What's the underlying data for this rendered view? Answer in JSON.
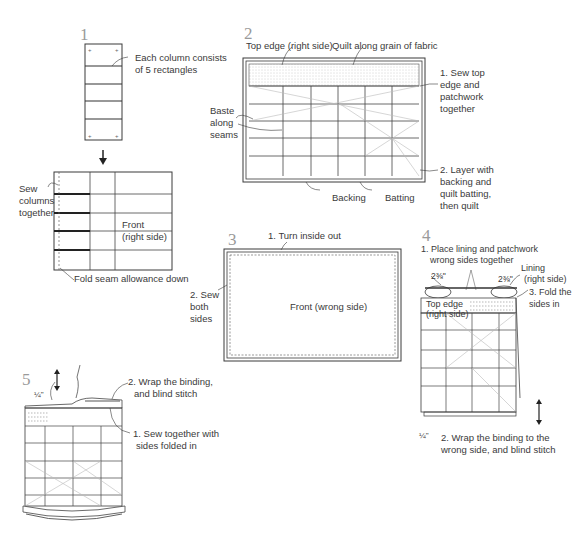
{
  "figure": {
    "type": "sewing-instruction-diagram",
    "steps": [
      {
        "number": "1",
        "labels": {
          "column": "Each column consists",
          "column_2": "of 5 rectangles",
          "sew_1": "Sew",
          "sew_2": "columns",
          "sew_3": "together",
          "front_1": "Front",
          "front_2": "(right side)",
          "fold": "Fold seam allowance down"
        }
      },
      {
        "number": "2",
        "labels": {
          "top_edge": "Top edge (right side)",
          "quilt": "Quilt along grain of fabric",
          "sew_top_1": "1. Sew top",
          "sew_top_2": "edge and",
          "sew_top_3": "patchwork",
          "sew_top_4": "together",
          "baste_1": "Baste",
          "baste_2": "along",
          "baste_3": "seams",
          "layer_1": "2. Layer with",
          "layer_2": "backing and",
          "layer_3": "quilt batting,",
          "layer_4": "then quilt",
          "backing": "Backing",
          "batting": "Batting"
        }
      },
      {
        "number": "3",
        "labels": {
          "turn": "1. Turn inside out",
          "sew_1": "2. Sew",
          "sew_2": "both",
          "sew_3": "sides",
          "front": "Front (wrong side)"
        }
      },
      {
        "number": "4",
        "labels": {
          "place_1": "1. Place lining and patchwork",
          "place_2": "wrong sides together",
          "measure_left": "2⅜\"",
          "measure_right": "2⅜\"",
          "lining_1": "Lining",
          "lining_2": "(right side)",
          "fold_1": "3. Fold the",
          "fold_2": "sides in",
          "top_edge_1": "Top edge",
          "top_edge_2": "(right side)",
          "quarter": "¼\"",
          "wrap_1": "2. Wrap the binding to the",
          "wrap_2": "wrong side, and blind stitch"
        }
      },
      {
        "number": "5",
        "labels": {
          "quarter": "¼\"",
          "wrap_1": "2. Wrap the binding,",
          "wrap_2": "and blind stitch",
          "sew_1": "1. Sew together with",
          "sew_2": "sides folded in"
        }
      }
    ]
  }
}
